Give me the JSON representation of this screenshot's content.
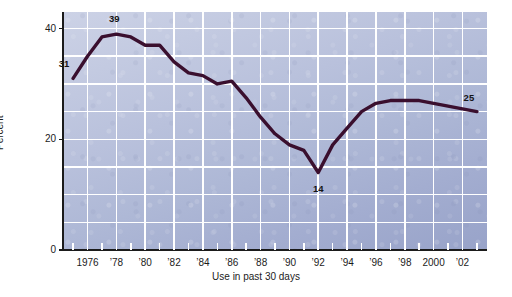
{
  "chart_data": {
    "type": "line",
    "title": "",
    "subtitle": "",
    "xlabel": "Use in past 30 days",
    "ylabel": "Percent",
    "xlim": [
      1974.3,
      2003.7
    ],
    "ylim": [
      0,
      43
    ],
    "grid": true,
    "legend": "none",
    "y_ticks": [
      0,
      20,
      40
    ],
    "y_tick_labels": [
      "0",
      "20",
      "40"
    ],
    "y_gridlines": [
      5,
      10,
      15,
      20,
      25,
      30,
      35,
      40
    ],
    "x_ticks": [
      1975,
      1976,
      1977,
      1978,
      1979,
      1980,
      1981,
      1982,
      1983,
      1984,
      1985,
      1986,
      1987,
      1988,
      1989,
      1990,
      1991,
      1992,
      1993,
      1994,
      1995,
      1996,
      1997,
      1998,
      1999,
      2000,
      2001,
      2002,
      2003
    ],
    "x_tick_labels": [
      {
        "x": 1976,
        "label": "1976"
      },
      {
        "x": 1978,
        "label": "’78"
      },
      {
        "x": 1980,
        "label": "’80"
      },
      {
        "x": 1982,
        "label": "’82"
      },
      {
        "x": 1984,
        "label": "’84"
      },
      {
        "x": 1986,
        "label": "’86"
      },
      {
        "x": 1988,
        "label": "’88"
      },
      {
        "x": 1990,
        "label": "’90"
      },
      {
        "x": 1992,
        "label": "’92"
      },
      {
        "x": 1994,
        "label": "’94"
      },
      {
        "x": 1996,
        "label": "’96"
      },
      {
        "x": 1998,
        "label": "’98"
      },
      {
        "x": 2000,
        "label": "2000"
      },
      {
        "x": 2002,
        "label": "’02"
      }
    ],
    "x_gridlines": [
      1976,
      1978,
      1980,
      1982,
      1984,
      1986,
      1988,
      1990,
      1992,
      1994,
      1996,
      1998,
      2000,
      2002
    ],
    "series": [
      {
        "name": "Use in past 30 days",
        "color": "#3a0f2e",
        "x": [
          1975,
          1976,
          1977,
          1978,
          1979,
          1980,
          1981,
          1982,
          1983,
          1984,
          1985,
          1986,
          1987,
          1988,
          1989,
          1990,
          1991,
          1992,
          1993,
          1994,
          1995,
          1996,
          1997,
          1998,
          1999,
          2000,
          2001,
          2002,
          2003
        ],
        "values": [
          31,
          35,
          38.5,
          39,
          38.5,
          37,
          37,
          34,
          32,
          31.5,
          30,
          30.5,
          27.5,
          24,
          21,
          19,
          18,
          14,
          19,
          22,
          25,
          26.5,
          27,
          27,
          27,
          26.5,
          26,
          25.5,
          25
        ]
      }
    ],
    "annotations": [
      {
        "x": 1975,
        "y": 31,
        "label": "31",
        "dx": -9,
        "dy": -14
      },
      {
        "x": 1978,
        "y": 39,
        "label": "39",
        "dx": -2,
        "dy": -15
      },
      {
        "x": 1992,
        "y": 14,
        "label": "14",
        "dx": 0,
        "dy": 16
      },
      {
        "x": 2003,
        "y": 25,
        "label": "25",
        "dx": -8,
        "dy": -14
      }
    ]
  },
  "colors": {
    "line": "#3a0f2e",
    "grid": "#ffffff",
    "axis": "#1b1b1b",
    "plot_background_top": "#ccd2e6",
    "plot_background_bottom": "#98a3c9",
    "text": "#1b1b1b"
  }
}
